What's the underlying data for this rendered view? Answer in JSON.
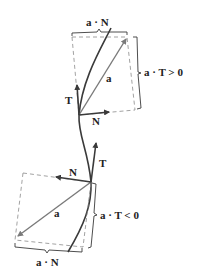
{
  "diagram": {
    "top_panel": {
      "a_dot_N_label": "a · N",
      "a_dot_T_label": "a · T > 0",
      "T_label": "T",
      "N_label": "N",
      "a_label": "a"
    },
    "bottom_panel": {
      "a_dot_N_label": "a · N",
      "a_dot_T_label": "a · T < 0",
      "T_label": "T",
      "N_label": "N",
      "a_label": "a"
    },
    "colors": {
      "curve": "#3a3a3a",
      "vector_a": "#7a7a7a",
      "dashed": "#8a8a8a",
      "text": "#222222"
    }
  }
}
